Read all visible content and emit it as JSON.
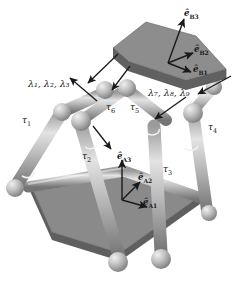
{
  "figure": {
    "kind": "three-legged parallel manipulator (Stewart platform)",
    "background": "#ffffff"
  },
  "colors": {
    "plate_top_face": "#8d8d8d",
    "plate_top_rim": "#6f6f6f",
    "plate_bottom_face": "#8a8a8a",
    "plate_bottom_rim": "#6b6b6b",
    "link_light": "#d8d8d8",
    "link_mid": "#ababab",
    "link_dark": "#7a7a7a",
    "sphere_light": "#e2e2e2",
    "sphere_mid": "#b0b0b0",
    "sphere_dark": "#838383",
    "ink": "#1a1a1a"
  },
  "labels": {
    "torques": [
      {
        "id": "tau-1",
        "base": "τ",
        "sub": "1",
        "x": 22,
        "y": 121
      },
      {
        "id": "tau-2",
        "base": "τ",
        "sub": "2",
        "x": 82,
        "y": 157
      },
      {
        "id": "tau-3",
        "base": "τ",
        "sub": "3",
        "x": 163,
        "y": 170
      },
      {
        "id": "tau-4",
        "base": "τ",
        "sub": "4",
        "x": 208,
        "y": 128
      },
      {
        "id": "tau-5",
        "base": "τ",
        "sub": "5",
        "x": 130,
        "y": 108
      },
      {
        "id": "tau-6",
        "base": "τ",
        "sub": "6",
        "x": 106,
        "y": 108
      }
    ],
    "lambdas": [
      {
        "id": "lambda-group-left",
        "text": "λ₁, λ₂, λ₃",
        "x": 28,
        "y": 84
      },
      {
        "id": "lambda-group-right",
        "text": "λ₇, λ₈, λ₉",
        "x": 148,
        "y": 93
      }
    ],
    "frame_b": {
      "name": "moving-platform-frame",
      "axes": [
        {
          "id": "e-b3",
          "base": "ê",
          "sub": "B3",
          "x": 184,
          "y": 14
        },
        {
          "id": "e-b2",
          "base": "ê",
          "sub": "B2",
          "x": 194,
          "y": 50
        },
        {
          "id": "e-b1",
          "base": "ê",
          "sub": "B1",
          "x": 193,
          "y": 70
        }
      ]
    },
    "frame_a": {
      "name": "base-platform-frame",
      "axes": [
        {
          "id": "e-a3",
          "base": "ê",
          "sub": "A3",
          "x": 120,
          "y": 157
        },
        {
          "id": "e-a2",
          "base": "ê",
          "sub": "A2",
          "x": 138,
          "y": 178
        },
        {
          "id": "e-a1",
          "base": "ê",
          "sub": "A1",
          "x": 143,
          "y": 203
        }
      ]
    }
  },
  "geometry": {
    "top_plate": {
      "face_points": "113,48 146,22 196,36 226,69 186,80 128,61",
      "rim_points": "113,48 128,61 186,80 226,69 226,79 186,90 128,71 113,58"
    },
    "bottom_plate": {
      "face_points": "30,183 122,168 200,196 120,253 52,232",
      "rim_points": "30,183 30,191 52,240 120,261 200,204 200,196 120,253 52,232"
    },
    "base_rods": [
      {
        "id": "base-rod-left",
        "x1": 30,
        "y1": 186,
        "x2": 122,
        "y2": 170
      },
      {
        "id": "base-rod-right",
        "x1": 122,
        "y1": 170,
        "x2": 202,
        "y2": 198
      }
    ],
    "legs": [
      {
        "id": "leg-1-upper",
        "x1": 62,
        "y1": 112,
        "x2": 105,
        "y2": 92
      },
      {
        "id": "leg-1-lower",
        "x1": 16,
        "y1": 186,
        "x2": 62,
        "y2": 112
      },
      {
        "id": "leg-2-upper",
        "x1": 78,
        "y1": 118,
        "x2": 118,
        "y2": 93
      },
      {
        "id": "leg-2-lower",
        "x1": 78,
        "y1": 118,
        "x2": 118,
        "y2": 258
      },
      {
        "id": "leg-3-upper",
        "x1": 166,
        "y1": 118,
        "x2": 128,
        "y2": 90
      },
      {
        "id": "leg-3-lower",
        "x1": 152,
        "y1": 128,
        "x2": 160,
        "y2": 255
      },
      {
        "id": "leg-4-upper",
        "x1": 190,
        "y1": 112,
        "x2": 212,
        "y2": 86
      },
      {
        "id": "leg-4-lower",
        "x1": 190,
        "y1": 112,
        "x2": 206,
        "y2": 214
      }
    ],
    "joints": [
      {
        "id": "joint-top-a",
        "cx": 105,
        "cy": 90,
        "r": 9
      },
      {
        "id": "joint-top-b",
        "cx": 127,
        "cy": 88,
        "r": 9
      },
      {
        "id": "joint-top-c",
        "cx": 213,
        "cy": 86,
        "r": 8
      },
      {
        "id": "joint-mid-a",
        "cx": 62,
        "cy": 112,
        "r": 9
      },
      {
        "id": "joint-mid-b",
        "cx": 80,
        "cy": 120,
        "r": 10
      },
      {
        "id": "joint-mid-c",
        "cx": 192,
        "cy": 113,
        "r": 10
      },
      {
        "id": "joint-base-l",
        "cx": 15,
        "cy": 188,
        "r": 9
      },
      {
        "id": "joint-base-b1",
        "cx": 118,
        "cy": 261,
        "r": 10
      },
      {
        "id": "joint-base-b2",
        "cx": 161,
        "cy": 258,
        "r": 10
      },
      {
        "id": "joint-base-r",
        "cx": 208,
        "cy": 212,
        "r": 8
      }
    ],
    "lambda_arrows": [
      {
        "id": "lambda-arrow-left",
        "x1": 116,
        "y1": 56,
        "x2": 88,
        "y2": 82,
        "double": true
      },
      {
        "id": "lambda-arrow-left2",
        "x1": 97,
        "y1": 100,
        "x2": 70,
        "y2": 78,
        "double": false
      },
      {
        "id": "lambda-arrow-mid",
        "x1": 129,
        "y1": 68,
        "x2": 110,
        "y2": 92,
        "double": false
      },
      {
        "id": "lambda-arrow-right",
        "x1": 229,
        "y1": 78,
        "x2": 196,
        "y2": 94,
        "double": true
      },
      {
        "id": "lambda-arrow-right2",
        "x1": 185,
        "y1": 98,
        "x2": 156,
        "y2": 118,
        "double": false
      },
      {
        "id": "tau2-arrow",
        "x1": 92,
        "y1": 127,
        "x2": 110,
        "y2": 148,
        "double": false
      }
    ],
    "frame_b_arrows": [
      {
        "id": "arrow-e-b3",
        "x1": 168,
        "y1": 63,
        "x2": 185,
        "y2": 18
      },
      {
        "id": "arrow-e-b2",
        "x1": 168,
        "y1": 63,
        "x2": 194,
        "y2": 53
      },
      {
        "id": "arrow-e-b1",
        "x1": 168,
        "y1": 63,
        "x2": 192,
        "y2": 73
      }
    ],
    "frame_a_arrows": [
      {
        "id": "arrow-e-a3",
        "x1": 122,
        "y1": 200,
        "x2": 122,
        "y2": 160
      },
      {
        "id": "arrow-e-a2",
        "x1": 122,
        "y1": 200,
        "x2": 139,
        "y2": 181
      },
      {
        "id": "arrow-e-a1",
        "x1": 122,
        "y1": 200,
        "x2": 146,
        "y2": 206
      }
    ]
  }
}
